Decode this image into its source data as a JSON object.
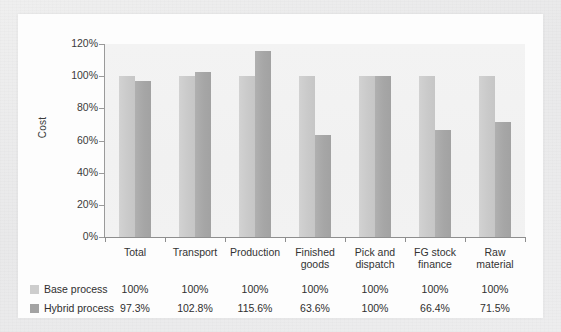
{
  "chart_data": {
    "type": "bar",
    "title": "",
    "xlabel": "",
    "ylabel": "Cost",
    "ylim": [
      0,
      120
    ],
    "ytick_labels": [
      "120%",
      "100%",
      "80%",
      "60%",
      "40%",
      "20%",
      "0%"
    ],
    "ytick_values": [
      120,
      100,
      80,
      60,
      40,
      20,
      0
    ],
    "grid": false,
    "legend_position": "bottom-table",
    "categories": [
      "Total",
      "Transport",
      "Production",
      "Finished goods",
      "Pick and dispatch",
      "FG stock finance",
      "Raw material"
    ],
    "category_lines": [
      [
        "Total"
      ],
      [
        "Transport"
      ],
      [
        "Production"
      ],
      [
        "Finished",
        "goods"
      ],
      [
        "Pick and",
        "dispatch"
      ],
      [
        "FG stock",
        "finance"
      ],
      [
        "Raw",
        "material"
      ]
    ],
    "series": [
      {
        "name": "Base process",
        "color": "#cdcdcd",
        "values": [
          100,
          100,
          100,
          100,
          100,
          100,
          100
        ],
        "value_labels": [
          "100%",
          "100%",
          "100%",
          "100%",
          "100%",
          "100%",
          "100%"
        ]
      },
      {
        "name": "Hybrid process",
        "color": "#a3a3a3",
        "values": [
          97.3,
          102.8,
          115.6,
          63.6,
          100,
          66.4,
          71.5
        ],
        "value_labels": [
          "97.3%",
          "102.8%",
          "115.6%",
          "63.6%",
          "100%",
          "66.4%",
          "71.5%"
        ]
      }
    ]
  },
  "colors": {
    "base_series": "#cdcdcd",
    "hybrid_series": "#a3a3a3",
    "plot_background": "#f2f2f2",
    "card_background": "#fdfdfd",
    "page_background": "#ededee",
    "axis_line": "#8e8e8e"
  }
}
